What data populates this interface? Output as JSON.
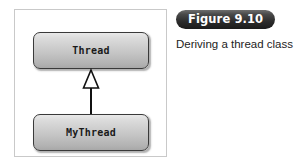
{
  "figure": {
    "badge_label": "Figure 9.10",
    "caption": "Deriving a thread class",
    "badge_bg_color": "#2c2c2c",
    "badge_text_color": "#ffffff",
    "caption_text_color": "#232323"
  },
  "diagram": {
    "type": "uml-class-diagram",
    "frame_border_color": "#c9c9c9",
    "background_color": "#ffffff",
    "boxes": [
      {
        "id": "thread",
        "label": "Thread",
        "role": "superclass",
        "border_color": "#3a3a3a",
        "fill_top_color": "#e9e9e9",
        "fill_bottom_color": "#a8a8a8"
      },
      {
        "id": "mythread",
        "label": "MyThread",
        "role": "subclass",
        "border_color": "#3a3a3a",
        "fill_top_color": "#e9e9e9",
        "fill_bottom_color": "#a8a8a8"
      }
    ],
    "relationship": {
      "kind": "generalization",
      "from": "MyThread",
      "to": "Thread",
      "arrowhead": "hollow-triangle",
      "line_color": "#111111",
      "arrow_fill_color": "#ffffff"
    }
  }
}
